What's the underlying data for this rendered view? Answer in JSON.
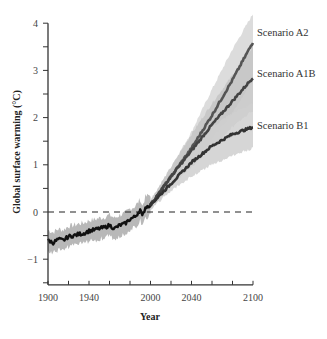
{
  "chart_data": {
    "type": "line",
    "title": "",
    "xlabel": "Year",
    "ylabel": "Global surface warming (°C)",
    "xlim": [
      1900,
      2100
    ],
    "ylim": [
      -1.5,
      4
    ],
    "x_ticks": [
      1900,
      1920,
      1940,
      1960,
      1980,
      2000,
      2020,
      2040,
      2060,
      2080,
      2100
    ],
    "x_tick_labels": [
      "1900",
      "1940",
      "2000",
      "2040",
      "2100"
    ],
    "x_tick_label_values": [
      1900,
      1940,
      2000,
      2040,
      2100
    ],
    "y_ticks": [
      -1.5,
      -1,
      -0.5,
      0,
      0.5,
      1,
      1.5,
      2,
      2.5,
      3,
      3.5,
      4
    ],
    "y_tick_labels": [
      "-1",
      "0",
      "1",
      "2",
      "3",
      "4"
    ],
    "y_tick_label_values": [
      -1,
      0,
      1,
      2,
      3,
      4
    ],
    "reference_line": {
      "y": 0,
      "style": "dashed"
    },
    "grid": false,
    "legend": "inline labels at right end of series",
    "historical": {
      "name": "Observed",
      "x": [
        1900,
        1905,
        1910,
        1915,
        1920,
        1925,
        1930,
        1935,
        1940,
        1945,
        1950,
        1955,
        1960,
        1965,
        1970,
        1975,
        1980,
        1985,
        1990,
        1992,
        1995,
        2000
      ],
      "y": [
        -0.6,
        -0.65,
        -0.58,
        -0.6,
        -0.52,
        -0.5,
        -0.47,
        -0.45,
        -0.4,
        -0.38,
        -0.35,
        -0.33,
        -0.28,
        -0.35,
        -0.28,
        -0.25,
        -0.15,
        -0.1,
        0.05,
        -0.1,
        0.1,
        0.15
      ],
      "uncertainty": 0.22
    },
    "series": [
      {
        "name": "Scenario A2",
        "x": [
          2000,
          2020,
          2040,
          2060,
          2080,
          2100
        ],
        "y": [
          0.15,
          0.75,
          1.35,
          2.05,
          2.8,
          3.6
        ],
        "low": [
          0.05,
          0.55,
          1.0,
          1.55,
          2.1,
          2.8
        ],
        "high": [
          0.25,
          0.95,
          1.7,
          2.6,
          3.45,
          4.2
        ]
      },
      {
        "name": "Scenario A1B",
        "x": [
          2000,
          2020,
          2040,
          2060,
          2080,
          2100
        ],
        "y": [
          0.15,
          0.75,
          1.3,
          1.85,
          2.35,
          2.85
        ],
        "low": [
          0.05,
          0.55,
          0.95,
          1.4,
          1.8,
          2.15
        ],
        "high": [
          0.25,
          0.95,
          1.65,
          2.3,
          2.9,
          3.5
        ]
      },
      {
        "name": "Scenario B1",
        "x": [
          2000,
          2020,
          2040,
          2060,
          2080,
          2100
        ],
        "y": [
          0.15,
          0.6,
          1.05,
          1.4,
          1.65,
          1.8
        ],
        "low": [
          0.05,
          0.45,
          0.75,
          1.0,
          1.2,
          1.35
        ],
        "high": [
          0.25,
          0.8,
          1.35,
          1.8,
          2.1,
          2.3
        ]
      }
    ]
  }
}
